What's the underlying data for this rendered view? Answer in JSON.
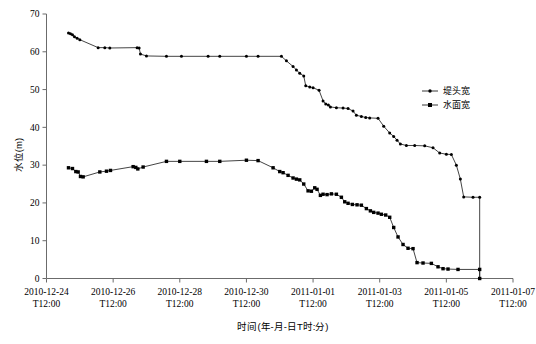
{
  "chart_data": {
    "type": "line",
    "title": "",
    "xlabel": "时间(年-月-日T时:分)",
    "ylabel": "水位(m)",
    "ylim": [
      0,
      70
    ],
    "ytick_step": 10,
    "yticks": [
      "0",
      "10",
      "20",
      "30",
      "40",
      "50",
      "60",
      "70"
    ],
    "grid": false,
    "legend_position": "inside-right-upper",
    "x_axis_type": "datetime",
    "xtick_labels": [
      {
        "line1": "2010-12-24",
        "line2": "T12:00"
      },
      {
        "line1": "2010-12-26",
        "line2": "T12:00"
      },
      {
        "line1": "2010-12-28",
        "line2": "T12:00"
      },
      {
        "line1": "2010-12-30",
        "line2": "T12:00"
      },
      {
        "line1": "2011-01-01",
        "line2": "T12:00"
      },
      {
        "line1": "2011-01-03",
        "line2": "T12:00"
      },
      {
        "line1": "2011-01-05",
        "line2": "T12:00"
      },
      {
        "line1": "2011-01-07",
        "line2": "T12:00"
      }
    ],
    "xlim_days": [
      0,
      14
    ],
    "series": [
      {
        "name": "堤头宽",
        "marker": "dot",
        "color": "#000000",
        "points": [
          [
            0.66,
            65.0
          ],
          [
            0.72,
            64.8
          ],
          [
            0.78,
            64.5
          ],
          [
            0.84,
            64.0
          ],
          [
            0.92,
            63.6
          ],
          [
            1.0,
            63.2
          ],
          [
            1.55,
            61.1
          ],
          [
            1.75,
            61.1
          ],
          [
            1.9,
            61.0
          ],
          [
            2.72,
            61.1
          ],
          [
            2.78,
            61.0
          ],
          [
            2.82,
            59.4
          ],
          [
            3.0,
            58.9
          ],
          [
            3.6,
            58.8
          ],
          [
            4.05,
            58.8
          ],
          [
            4.85,
            58.8
          ],
          [
            5.2,
            58.8
          ],
          [
            6.0,
            58.8
          ],
          [
            6.35,
            58.8
          ],
          [
            7.05,
            58.8
          ],
          [
            7.2,
            57.6
          ],
          [
            7.4,
            56.1
          ],
          [
            7.5,
            55.2
          ],
          [
            7.6,
            54.3
          ],
          [
            7.72,
            53.6
          ],
          [
            7.78,
            51.0
          ],
          [
            7.9,
            50.7
          ],
          [
            8.0,
            50.5
          ],
          [
            8.18,
            49.8
          ],
          [
            8.3,
            47.0
          ],
          [
            8.38,
            46.2
          ],
          [
            8.46,
            45.9
          ],
          [
            8.52,
            45.4
          ],
          [
            8.7,
            45.2
          ],
          [
            8.9,
            45.1
          ],
          [
            9.05,
            45.0
          ],
          [
            9.2,
            44.3
          ],
          [
            9.3,
            43.2
          ],
          [
            9.45,
            42.9
          ],
          [
            9.58,
            42.6
          ],
          [
            9.7,
            42.5
          ],
          [
            9.95,
            42.4
          ],
          [
            10.12,
            40.3
          ],
          [
            10.3,
            38.5
          ],
          [
            10.42,
            37.6
          ],
          [
            10.52,
            36.6
          ],
          [
            10.62,
            35.6
          ],
          [
            10.8,
            35.2
          ],
          [
            11.05,
            35.2
          ],
          [
            11.35,
            35.1
          ],
          [
            11.6,
            34.6
          ],
          [
            11.8,
            33.2
          ],
          [
            12.0,
            32.9
          ],
          [
            12.15,
            32.8
          ],
          [
            12.3,
            30.0
          ],
          [
            12.42,
            26.3
          ],
          [
            12.52,
            21.6
          ],
          [
            12.8,
            21.5
          ],
          [
            13.0,
            21.5
          ],
          [
            13.0,
            0.0
          ]
        ]
      },
      {
        "name": "水面宽",
        "marker": "square",
        "color": "#000000",
        "points": [
          [
            0.66,
            29.3
          ],
          [
            0.78,
            29.1
          ],
          [
            0.88,
            28.3
          ],
          [
            0.95,
            28.2
          ],
          [
            1.02,
            27.0
          ],
          [
            1.1,
            26.9
          ],
          [
            1.6,
            28.2
          ],
          [
            1.8,
            28.4
          ],
          [
            1.92,
            28.6
          ],
          [
            2.6,
            29.6
          ],
          [
            2.68,
            29.4
          ],
          [
            2.74,
            29.0
          ],
          [
            2.9,
            29.5
          ],
          [
            3.6,
            31.0
          ],
          [
            4.0,
            31.0
          ],
          [
            4.8,
            31.0
          ],
          [
            5.2,
            31.0
          ],
          [
            6.0,
            31.3
          ],
          [
            6.35,
            31.2
          ],
          [
            6.8,
            29.3
          ],
          [
            7.0,
            28.3
          ],
          [
            7.1,
            28.0
          ],
          [
            7.25,
            27.3
          ],
          [
            7.4,
            26.6
          ],
          [
            7.5,
            26.3
          ],
          [
            7.6,
            26.1
          ],
          [
            7.72,
            25.0
          ],
          [
            7.85,
            23.2
          ],
          [
            7.95,
            23.1
          ],
          [
            8.05,
            24.0
          ],
          [
            8.12,
            23.6
          ],
          [
            8.22,
            22.0
          ],
          [
            8.3,
            22.3
          ],
          [
            8.42,
            22.2
          ],
          [
            8.55,
            22.4
          ],
          [
            8.7,
            22.3
          ],
          [
            8.85,
            21.5
          ],
          [
            8.95,
            20.3
          ],
          [
            9.05,
            19.9
          ],
          [
            9.18,
            19.6
          ],
          [
            9.32,
            19.5
          ],
          [
            9.45,
            19.4
          ],
          [
            9.6,
            18.5
          ],
          [
            9.72,
            17.9
          ],
          [
            9.82,
            17.5
          ],
          [
            9.95,
            17.3
          ],
          [
            10.05,
            17.0
          ],
          [
            10.18,
            16.8
          ],
          [
            10.3,
            16.2
          ],
          [
            10.42,
            13.5
          ],
          [
            10.55,
            11.0
          ],
          [
            10.7,
            9.0
          ],
          [
            10.85,
            8.0
          ],
          [
            11.0,
            7.9
          ],
          [
            11.12,
            4.2
          ],
          [
            11.3,
            4.1
          ],
          [
            11.55,
            4.0
          ],
          [
            11.75,
            3.1
          ],
          [
            11.9,
            2.6
          ],
          [
            12.05,
            2.5
          ],
          [
            12.35,
            2.4
          ],
          [
            13.0,
            2.4
          ],
          [
            13.0,
            0.0
          ]
        ]
      }
    ]
  },
  "legend": {
    "entries": [
      {
        "label": "堤头宽",
        "marker": "dot"
      },
      {
        "label": "水面宽",
        "marker": "square"
      }
    ]
  }
}
